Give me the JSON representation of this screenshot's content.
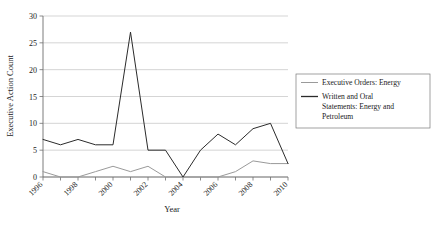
{
  "chart_data": {
    "type": "line",
    "title": "",
    "xlabel": "Year",
    "ylabel": "Executive Action Count",
    "x": [
      1996,
      1997,
      1998,
      1999,
      2000,
      2001,
      2002,
      2003,
      2004,
      2005,
      2006,
      2007,
      2008,
      2009,
      2010
    ],
    "xlim": [
      1996,
      2010
    ],
    "ylim": [
      0,
      30
    ],
    "xtick_labels": [
      "1996",
      "1998",
      "2000",
      "2002",
      "2004",
      "2006",
      "2008",
      "2010"
    ],
    "xtick_values": [
      1996,
      1998,
      2000,
      2002,
      2004,
      2006,
      2008,
      2010
    ],
    "ytick_labels": [
      "0",
      "5",
      "10",
      "15",
      "20",
      "25",
      "30"
    ],
    "ytick_values": [
      0,
      5,
      10,
      15,
      20,
      25,
      30
    ],
    "grid": "horizontal",
    "legend_position": "right",
    "series": [
      {
        "name": "Executive Orders: Energy",
        "color": "#9a9a9a",
        "values": [
          1,
          0,
          0,
          1,
          2,
          1,
          2,
          0,
          0,
          0,
          0,
          1,
          3,
          2.5,
          2.5
        ]
      },
      {
        "name": "Written and Oral Statements: Energy and Petroleum",
        "color": "#2b2b2b",
        "values": [
          7,
          6,
          7,
          6,
          6,
          27,
          5,
          5,
          0,
          5,
          8,
          6,
          9,
          10,
          2.5
        ]
      }
    ]
  },
  "legend": {
    "entries": [
      {
        "label": "Executive Orders: Energy",
        "color": "#9a9a9a"
      },
      {
        "label": "Written and Oral Statements: Energy and Petroleum",
        "color": "#2b2b2b"
      }
    ],
    "entry_lines": [
      [
        "Executive Orders: Energy"
      ],
      [
        "Written and Oral",
        "Statements: Energy and",
        "Petroleum"
      ]
    ]
  }
}
